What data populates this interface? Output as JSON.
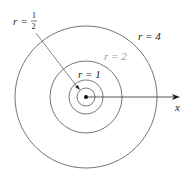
{
  "diagram": {
    "type": "concentric-circles",
    "center": {
      "x": 86,
      "y": 97
    },
    "circles": [
      {
        "label": "r = 1/2",
        "value": 0.5,
        "radius_px": 9
      },
      {
        "label": "r = 1",
        "value": 1,
        "radius_px": 17
      },
      {
        "label": "r = 2",
        "value": 2,
        "radius_px": 36
      },
      {
        "label": "r = 4",
        "value": 4,
        "radius_px": 71
      }
    ],
    "labels": {
      "r_half_var": "r",
      "r_half_eq": "=",
      "r_half_num": "1",
      "r_half_den": "2",
      "r1": "r = 1",
      "r2": "r = 2",
      "r4": "r = 4",
      "x_axis": "x"
    },
    "colors": {
      "stroke": "#555555",
      "r2_label": "#9a9a9a",
      "text": "#222222"
    }
  }
}
